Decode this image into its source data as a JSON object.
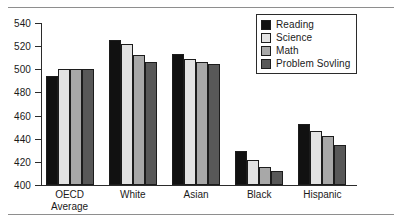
{
  "figure": {
    "top_sliver_text": "",
    "frame_color": "#8e8e8e"
  },
  "chart_data": {
    "type": "bar",
    "title": "",
    "subtitle": "",
    "xlabel": "",
    "ylabel": "",
    "ylim": [
      400,
      540
    ],
    "yticks": [
      400,
      420,
      440,
      460,
      480,
      500,
      520,
      540
    ],
    "ytick_labels": [
      "400",
      "420",
      "440",
      "460",
      "480",
      "500",
      "520",
      "540"
    ],
    "grid": false,
    "legend_position": "top-right",
    "categories": [
      "OECD Average",
      "White",
      "Asian",
      "Black",
      "Hispanic"
    ],
    "category_lines": [
      [
        "OECD",
        "Average"
      ],
      [
        "White"
      ],
      [
        "Asian"
      ],
      [
        "Black"
      ],
      [
        "Hispanic"
      ]
    ],
    "series": [
      {
        "name": "Reading",
        "color": "#111111",
        "values": [
          494,
          525,
          513,
          429,
          453
        ]
      },
      {
        "name": "Science",
        "color": "#e3e3e3",
        "values": [
          500,
          522,
          509,
          422,
          447
        ]
      },
      {
        "name": "Math",
        "color": "#a8a8a8",
        "values": [
          500,
          512,
          506,
          416,
          442
        ]
      },
      {
        "name": "Problem Sovling",
        "color": "#585858",
        "values": [
          500,
          506,
          505,
          412,
          435
        ]
      }
    ]
  }
}
